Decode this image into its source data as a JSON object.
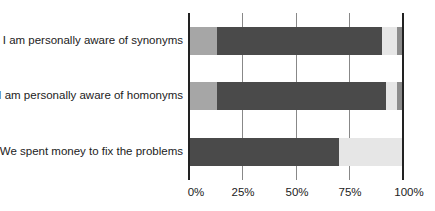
{
  "chart_data": {
    "type": "bar",
    "orientation": "horizontal",
    "stacked": true,
    "normalized": true,
    "title": "",
    "xlabel": "",
    "ylabel": "",
    "xlim": [
      0,
      100
    ],
    "grid": true,
    "legend": null,
    "x_ticks": [
      "0%",
      "25%",
      "50%",
      "75%",
      "100%"
    ],
    "categories": [
      "I am personally aware of synonyms",
      "I am personally aware of homonyms",
      "We spent money to fix the problems"
    ],
    "series": [
      {
        "name": "segment-1",
        "color": "#a6a6a6",
        "values": [
          13,
          13,
          0
        ]
      },
      {
        "name": "segment-2",
        "color": "#4a4a4a",
        "values": [
          77,
          79,
          70
        ]
      },
      {
        "name": "segment-3",
        "color": "#e6e6e6",
        "values": [
          7,
          5,
          30
        ]
      },
      {
        "name": "segment-4",
        "color": "#8c8c8c",
        "values": [
          3,
          3,
          0
        ]
      }
    ]
  }
}
